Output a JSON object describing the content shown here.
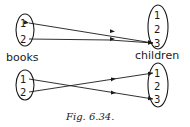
{
  "figure": {
    "caption": "Fig. 6.34.",
    "diagrams": [
      {
        "domain_label": "books",
        "codomain_label": "children",
        "domain": [
          "1",
          "2"
        ],
        "codomain": [
          "1",
          "2",
          "3"
        ],
        "mapping": [
          {
            "from": "1",
            "to": "3"
          },
          {
            "from": "2",
            "to": "3"
          }
        ]
      },
      {
        "domain_label": "books",
        "codomain_label": "children",
        "domain": [
          "1",
          "2"
        ],
        "codomain": [
          "1",
          "2",
          "3"
        ],
        "mapping": [
          {
            "from": "1",
            "to": "3"
          },
          {
            "from": "2",
            "to": "1"
          }
        ]
      }
    ]
  },
  "colors": {
    "ink": "#1a1a1a",
    "background": "#ffffff"
  }
}
